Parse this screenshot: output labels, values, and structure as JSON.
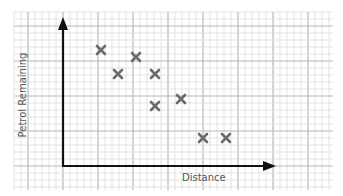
{
  "chart_data": {
    "type": "scatter",
    "title": "",
    "xlabel": "Distance",
    "ylabel": "Petrol Remaining",
    "grid": true,
    "axis_ticks": false,
    "marker": "x",
    "marker_color": "#6b6b6b",
    "points_px": [
      {
        "x": 101,
        "y": 50
      },
      {
        "x": 136,
        "y": 57
      },
      {
        "x": 118,
        "y": 74
      },
      {
        "x": 155,
        "y": 74
      },
      {
        "x": 181,
        "y": 99
      },
      {
        "x": 155,
        "y": 106
      },
      {
        "x": 203,
        "y": 138
      },
      {
        "x": 226,
        "y": 138
      }
    ],
    "points_grid_units": [
      {
        "x": 5.5,
        "y": 16.5
      },
      {
        "x": 10.5,
        "y": 15.5
      },
      {
        "x": 8.0,
        "y": 13.0
      },
      {
        "x": 13.0,
        "y": 13.0
      },
      {
        "x": 17.0,
        "y": 9.5
      },
      {
        "x": 13.0,
        "y": 8.5
      },
      {
        "x": 20.0,
        "y": 4.0
      },
      {
        "x": 23.5,
        "y": 4.0
      }
    ],
    "trend": "negative correlation"
  },
  "labels": {
    "x_axis": "Distance",
    "y_axis": "Petrol Remaining"
  }
}
